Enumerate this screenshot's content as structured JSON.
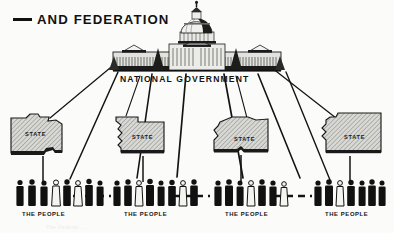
{
  "meta": {
    "width": 394,
    "height": 233,
    "background_color": "#fbfbf9",
    "ink_color": "#111111"
  },
  "title": {
    "text": "AND FEDERATION",
    "leading_dash": true
  },
  "national_government": {
    "label": "NATIONAL GOVERNMENT",
    "icon": "capitol-building-icon"
  },
  "states": [
    {
      "label": "STATE",
      "shape": "irregular-state-outline"
    },
    {
      "label": "STATE",
      "shape": "irregular-state-outline"
    },
    {
      "label": "STATE",
      "shape": "irregular-state-outline"
    },
    {
      "label": "STATE",
      "shape": "irregular-state-outline"
    }
  ],
  "people_groups": [
    {
      "label": "THE PEOPLE",
      "figure_count": 8
    },
    {
      "label": "THE PEOPLE",
      "figure_count": 8
    },
    {
      "label": "THE PEOPLE",
      "figure_count": 8
    },
    {
      "label": "THE PEOPLE",
      "figure_count": 8
    }
  ],
  "ghost_caption": {
    "text": "The Federal ..."
  },
  "legend_note": {
    "connector_national_to_people": "solid line",
    "connector_state_to_people": "solid vertical stem",
    "connector_people_to_people": "dashed line"
  }
}
